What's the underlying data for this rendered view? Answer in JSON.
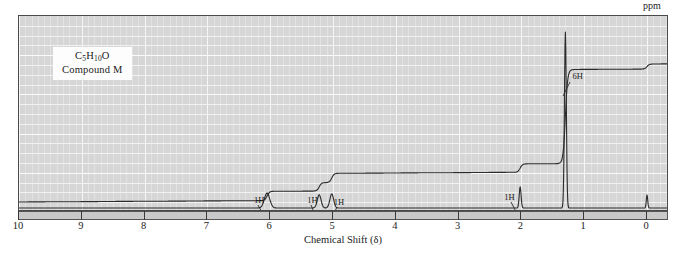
{
  "label_box": {
    "formula_prefix": "C",
    "formula_sub1": "5",
    "formula_mid": "H",
    "formula_sub2": "10",
    "formula_suffix": "O",
    "compound_name": "Compound M"
  },
  "axis": {
    "title": "Chemical Shift (δ)",
    "unit_label": "ppm",
    "tick_labels": [
      "10",
      "9",
      "8",
      "7",
      "6",
      "5",
      "4",
      "3",
      "2",
      "1",
      "0"
    ]
  },
  "annotations": [
    {
      "text": "1H",
      "shift": 6.05
    },
    {
      "text": "1H",
      "shift": 5.22
    },
    {
      "text": "1H",
      "shift": 5.02
    },
    {
      "text": "1H",
      "shift": 2.02
    },
    {
      "text": "6H",
      "shift": 1.3
    }
  ],
  "colors": {
    "plot_background": "#d6d6d6",
    "grid_minor": "#e2e2e2",
    "grid_major": "#f6f6f6",
    "trace": "#2b2b2b",
    "frame": "#4a4a4a",
    "axis_strip": "#c9c9c9",
    "page_background": "#ffffff"
  },
  "chart_data": {
    "type": "line",
    "title": "",
    "subtitle": "",
    "xlabel": "Chemical Shift (δ)",
    "ylabel": "",
    "xlim": [
      10,
      -0.35
    ],
    "ylim": [
      0,
      1
    ],
    "x_unit": "ppm",
    "grid": true,
    "legend": "none",
    "axis_direction": "reversed",
    "series": [
      {
        "name": "1H NMR spectrum",
        "type": "peaks",
        "peaks": [
          {
            "shift": 6.05,
            "relative_height": 0.085,
            "width_ppm": 0.085,
            "integration": "1H"
          },
          {
            "shift": 5.22,
            "relative_height": 0.075,
            "width_ppm": 0.06,
            "integration": "1H"
          },
          {
            "shift": 5.02,
            "relative_height": 0.08,
            "width_ppm": 0.06,
            "integration": "1H"
          },
          {
            "shift": 2.02,
            "relative_height": 0.12,
            "width_ppm": 0.03,
            "integration": "1H"
          },
          {
            "shift": 1.3,
            "relative_height": 1.0,
            "width_ppm": 0.03,
            "integration": "6H"
          },
          {
            "shift": 0.0,
            "relative_height": 0.075,
            "width_ppm": 0.022,
            "integration": "TMS"
          }
        ]
      },
      {
        "name": "integration trace",
        "type": "step",
        "steps": [
          {
            "shift": 6.05,
            "rise": 0.055,
            "integration": "1H"
          },
          {
            "shift": 5.22,
            "rise": 0.05,
            "integration": "1H"
          },
          {
            "shift": 5.02,
            "rise": 0.055,
            "integration": "1H"
          },
          {
            "shift": 2.02,
            "rise": 0.05,
            "integration": "1H"
          },
          {
            "shift": 1.3,
            "rise": 0.56,
            "integration": "6H"
          },
          {
            "shift": 0.0,
            "rise": 0.03,
            "integration": "TMS"
          }
        ]
      }
    ],
    "annotation_labels": [
      "1H",
      "1H",
      "1H",
      "1H",
      "6H"
    ]
  }
}
